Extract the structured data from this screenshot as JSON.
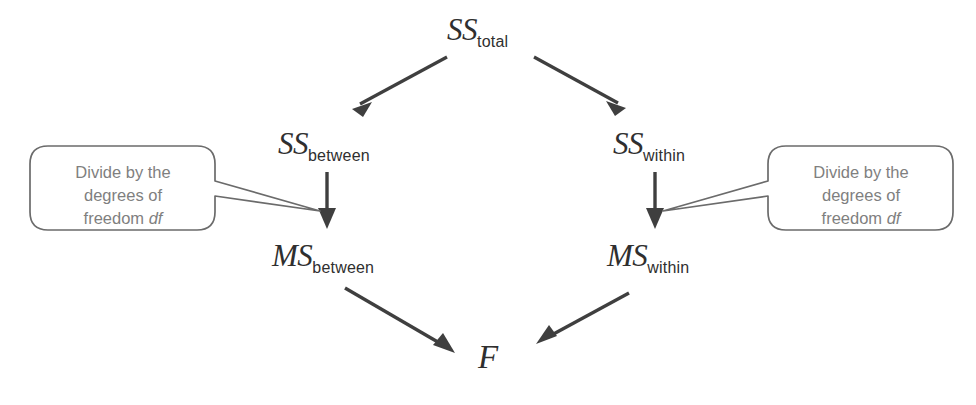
{
  "diagram": {
    "line_color": "#3f3f3f",
    "text_color": "#2f2f2f",
    "bubble_text_color": "#7f7f7f",
    "bubble_border_color": "#6b6b6b",
    "background": "#ffffff",
    "nodes": {
      "ss_total": {
        "base": "SS",
        "sub": "total"
      },
      "ss_between": {
        "base": "SS",
        "sub": "between"
      },
      "ss_within": {
        "base": "SS",
        "sub": "within"
      },
      "ms_between": {
        "base": "MS",
        "sub": "between"
      },
      "ms_within": {
        "base": "MS",
        "sub": "within"
      },
      "f": {
        "base": "F",
        "sub": ""
      }
    },
    "callouts": {
      "left": {
        "line1": "Divide by the",
        "line2": "degrees of",
        "line3_prefix": "freedom ",
        "line3_italic": "df"
      },
      "right": {
        "line1": "Divide by the",
        "line2": "degrees of",
        "line3_prefix": "freedom ",
        "line3_italic": "df"
      }
    },
    "arrows": [
      {
        "name": "ss-total-to-ss-between",
        "from": "ss_total",
        "to": "ss_between"
      },
      {
        "name": "ss-total-to-ss-within",
        "from": "ss_total",
        "to": "ss_within"
      },
      {
        "name": "ss-between-to-ms-between",
        "from": "ss_between",
        "to": "ms_between"
      },
      {
        "name": "ss-within-to-ms-within",
        "from": "ss_within",
        "to": "ms_within"
      },
      {
        "name": "ms-between-to-f",
        "from": "ms_between",
        "to": "f"
      },
      {
        "name": "ms-within-to-f",
        "from": "ms_within",
        "to": "f"
      }
    ]
  }
}
